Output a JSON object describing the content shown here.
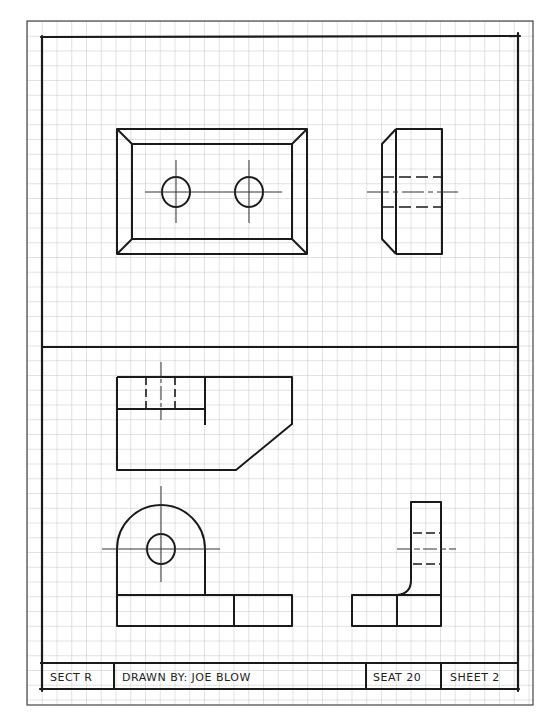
{
  "sheet": {
    "type": "orthographic-drawing-exercise",
    "grid_spacing_px": 14.75,
    "colors": {
      "paper": "#ffffff",
      "grid": "#b8b8b8",
      "ink": "#1a1a1a",
      "grid_border": "#444444"
    }
  },
  "title_block": {
    "section": "SECT R",
    "drawn_by": "DRAWN BY: JOE BLOW",
    "seat": "SEAT 20",
    "sheet": "SHEET 2"
  },
  "panels": [
    {
      "name": "upper-panel",
      "views": [
        "front-view-plate",
        "side-view-plate"
      ]
    },
    {
      "name": "lower-panel",
      "views": [
        "top-view-bracket",
        "front-view-bracket",
        "side-view-bracket"
      ]
    }
  ]
}
